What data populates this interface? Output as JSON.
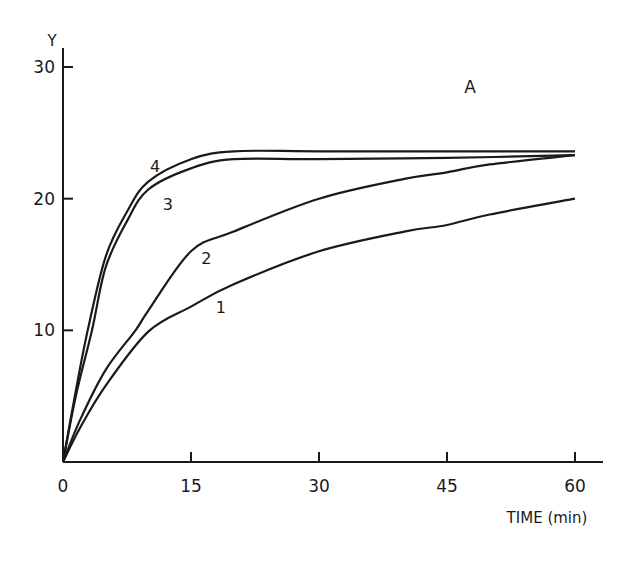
{
  "chart_data": {
    "type": "line",
    "title": "",
    "panel_label": "A",
    "xlabel": "TIME (min)",
    "ylabel": "Y",
    "xlim": [
      0,
      63
    ],
    "ylim": [
      0,
      31
    ],
    "x_ticks": [
      0,
      15,
      30,
      45,
      60
    ],
    "x_tick_labels": [
      "0",
      "15",
      "30",
      "45",
      "60"
    ],
    "y_ticks": [
      10,
      20,
      30
    ],
    "y_tick_labels": [
      "10",
      "20",
      "30"
    ],
    "grid": false,
    "legend": "inline curve numbers",
    "series": [
      {
        "name": "1",
        "x": [
          0,
          2,
          5,
          10,
          15,
          20,
          30,
          40,
          45,
          50,
          60
        ],
        "y": [
          0,
          2.6,
          5.8,
          9.9,
          11.8,
          13.5,
          16.0,
          17.5,
          18.0,
          18.8,
          20.0
        ]
      },
      {
        "name": "2",
        "x": [
          0,
          2,
          5,
          8.5,
          10,
          15,
          20,
          30,
          40,
          45,
          50,
          60
        ],
        "y": [
          0,
          3.2,
          7.0,
          10.0,
          11.5,
          16.0,
          17.5,
          20.0,
          21.5,
          22.0,
          22.6,
          23.3
        ]
      },
      {
        "name": "3",
        "x": [
          0,
          1.5,
          3.4,
          5,
          7.5,
          10,
          15,
          20,
          30,
          45,
          60
        ],
        "y": [
          0,
          5.0,
          10.0,
          14.8,
          18.3,
          20.7,
          22.3,
          23.0,
          23.0,
          23.1,
          23.3
        ]
      },
      {
        "name": "4",
        "x": [
          0,
          1.5,
          2.9,
          5,
          7.5,
          10,
          15,
          20,
          30,
          45,
          60
        ],
        "y": [
          0,
          5.4,
          10.0,
          15.6,
          19.0,
          21.3,
          23.0,
          23.6,
          23.6,
          23.6,
          23.6
        ]
      }
    ],
    "curve_labels": [
      {
        "text": "1",
        "x": 18.5,
        "y": 11.8
      },
      {
        "text": "2",
        "x": 16.8,
        "y": 15.5
      },
      {
        "text": "3",
        "x": 12.3,
        "y": 19.6
      },
      {
        "text": "4",
        "x": 10.8,
        "y": 22.5
      }
    ]
  }
}
